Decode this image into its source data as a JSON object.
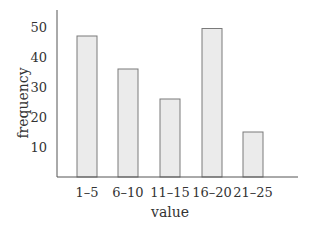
{
  "chart_data": {
    "type": "bar",
    "title": "",
    "xlabel": "value",
    "ylabel": "frequency",
    "categories": [
      "1–5",
      "6–10",
      "11–15",
      "16–20",
      "21–25"
    ],
    "values": [
      47,
      36,
      26,
      49.5,
      15
    ],
    "yticks": [
      10,
      20,
      30,
      40,
      50
    ],
    "ylim": [
      0,
      55
    ],
    "grid": false,
    "legend": null,
    "colors": {
      "bar_fill": "#ebebeb",
      "bar_stroke": "#7a7a7a",
      "axis": "#555555"
    }
  }
}
